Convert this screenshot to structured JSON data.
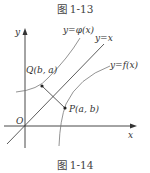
{
  "captions": {
    "top": "图 1-13",
    "bottom": "图 1-14"
  },
  "axes": {
    "x_label": "x",
    "y_label": "y",
    "origin_label": "O"
  },
  "curves": {
    "phi": "y=φ(x)",
    "identity": "y=x",
    "f": "y=f(x)"
  },
  "points": {
    "Q": "Q(b, a)",
    "P": "P(a, b)"
  },
  "colors": {
    "axis": "#333333",
    "curve": "#666666",
    "line": "#333333"
  }
}
